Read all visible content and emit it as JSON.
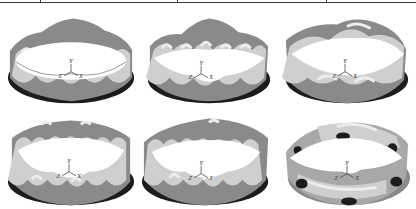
{
  "figure": {
    "colors": {
      "dark_band": "#1c1c1c",
      "mid_gray": "#8a8a8a",
      "light_gray": "#cfcfcf",
      "highlight": "#ececec",
      "background": "#ffffff"
    },
    "panels": [
      {
        "id": "a",
        "row": 1,
        "col": 1,
        "lobes": 8,
        "axis_labels": {
          "y": "Y",
          "z": "Z",
          "x": "X"
        }
      },
      {
        "id": "b",
        "row": 1,
        "col": 2,
        "lobes": 8,
        "axis_labels": {
          "y": "Y",
          "z": "Z",
          "x": "X"
        }
      },
      {
        "id": "c",
        "row": 1,
        "col": 3,
        "lobes": 4,
        "axis_labels": {
          "y": "Y",
          "z": "Z",
          "x": "X"
        }
      },
      {
        "id": "d",
        "row": 2,
        "col": 1,
        "lobes": 10,
        "axis_labels": {
          "y": "Y",
          "z": "Z",
          "x": "X"
        }
      },
      {
        "id": "e",
        "row": 2,
        "col": 2,
        "lobes": 10,
        "axis_labels": {
          "y": "Y",
          "z": "Z",
          "x": "X"
        }
      },
      {
        "id": "f",
        "row": 2,
        "col": 3,
        "lobes": 2,
        "axis_labels": {
          "y": "Y",
          "z": "Z",
          "x": "X"
        }
      }
    ]
  }
}
